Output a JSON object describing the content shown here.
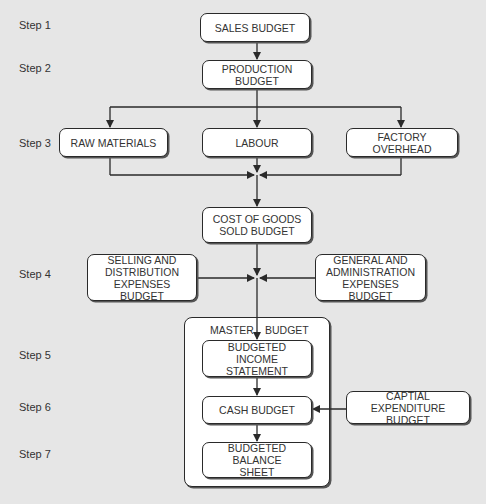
{
  "diagram": {
    "title_partial": "Budget Preparation Flow",
    "steps": [
      {
        "label": "Step 1"
      },
      {
        "label": "Step 2"
      },
      {
        "label": "Step 3"
      },
      {
        "label": "Step 4"
      },
      {
        "label": "Step 5"
      },
      {
        "label": "Step 6"
      },
      {
        "label": "Step 7"
      }
    ],
    "nodes": {
      "sales_budget": "SALES BUDGET",
      "production_budget": "PRODUCTION\nBUDGET",
      "raw_materials": "RAW MATERIALS",
      "labour": "LABOUR",
      "factory_overhead": "FACTORY\nOVERHEAD",
      "cogs_budget": "COST OF GOODS\nSOLD BUDGET",
      "selling_distribution": "SELLING AND\nDISTRIBUTION\nEXPENSES BUDGET",
      "general_admin": "GENERAL AND\nADMINISTRATION\nEXPENSES BUDGET",
      "income_statement": "BUDGETED INCOME\nSTATEMENT",
      "cash_budget": "CASH BUDGET",
      "capital_expenditure": "CAPTIAL EXPENDITURE\nBUDGET",
      "balance_sheet": "BUDGETED BALANCE\nSHEET"
    },
    "master_budget": {
      "label_left": "MASTER",
      "label_right": "BUDGET"
    },
    "colors": {
      "background": "#e6e6e6",
      "box_fill": "#ffffff",
      "line": "#2a2a2a",
      "text": "#333333"
    }
  }
}
